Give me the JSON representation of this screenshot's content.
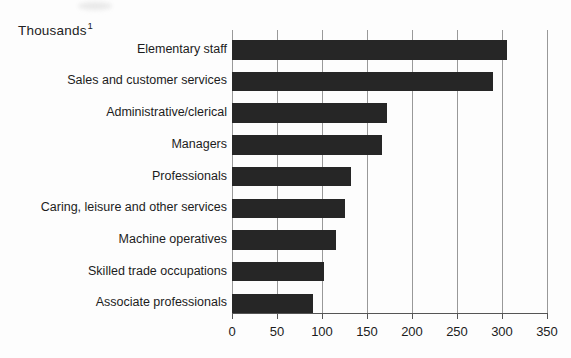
{
  "title": {
    "text": "Thousands",
    "superscript": "1"
  },
  "chart_data": {
    "type": "bar",
    "orientation": "horizontal",
    "title": "Thousands",
    "unit_note": "Thousands",
    "footnote_marker": "1",
    "categories": [
      "Elementary staff",
      "Sales and customer services",
      "Administrative/clerical",
      "Managers",
      "Professionals",
      "Caring, leisure and other services",
      "Machine operatives",
      "Skilled trade occupations",
      "Associate professionals"
    ],
    "values": [
      306,
      290,
      172,
      167,
      132,
      126,
      116,
      102,
      90
    ],
    "xlabel": "",
    "ylabel": "",
    "xlim": [
      0,
      350
    ],
    "xticks": [
      0,
      50,
      100,
      150,
      200,
      250,
      300,
      350
    ],
    "grid": true,
    "legend": "none",
    "colors": {
      "bar": "#262626",
      "gridline": "#999999",
      "axis": "#555555",
      "text": "#1c1c1c",
      "background": "#fdfdfd"
    }
  }
}
